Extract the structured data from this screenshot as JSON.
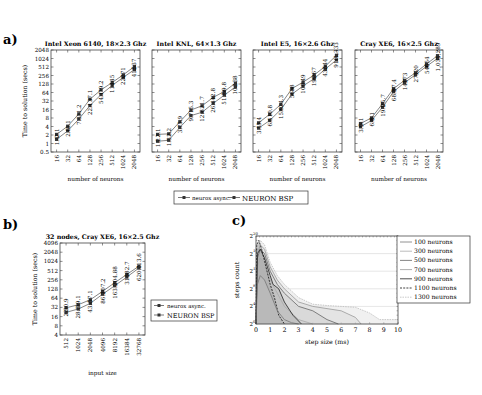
{
  "panel_labels": {
    "a": "a)",
    "b": "b)",
    "c": "c)"
  },
  "colors": {
    "async": "#666666",
    "bsp": "#666666",
    "frame": "#444444",
    "marker": "#333333"
  },
  "chart_data": [
    {
      "id": "a1",
      "type": "line",
      "title": "Intel Xeon 6140, 18×2.3 Ghz",
      "xlabel": "number of neurons",
      "ylabel": "Time to solution (secs)",
      "x": [
        16,
        32,
        64,
        128,
        256,
        512,
        1024,
        2048
      ],
      "yticks": [
        "0.5",
        "1",
        "2",
        "4",
        "8",
        "16",
        "32",
        "64",
        "128",
        "256",
        "512",
        "1024",
        "2048"
      ],
      "ylim_log2": [
        -1,
        11
      ],
      "series": [
        {
          "name": "neurox async.",
          "values": [
            1.4,
            2.8,
            7.3,
            22.1,
            54.1,
            114,
            220,
            415
          ],
          "labels": [
            "1.4",
            "2.8",
            "7.3",
            "22.1",
            "54.1",
            "114",
            "220",
            "415"
          ]
        },
        {
          "name": "NEURON BSP",
          "values": [
            2.1,
            4.1,
            11.2,
            37.1,
            79.2,
            145,
            271,
            537
          ],
          "labels": [
            "2.1",
            "4.1",
            "11.2",
            "37.1",
            "79.2",
            "145",
            "271",
            "537"
          ]
        }
      ]
    },
    {
      "id": "a2",
      "type": "line",
      "title": "Intel KNL, 64×1.3 Ghz",
      "xlabel": "number of neurons",
      "ylabel": "",
      "x": [
        16,
        32,
        64,
        128,
        256,
        512,
        1024,
        2048
      ],
      "ylim_log2": [
        -1,
        11
      ],
      "series": [
        {
          "name": "neurox async.",
          "values": [
            1.2,
            1.3,
            3.7,
            9.7,
            12.8,
            26.4,
            51.5,
            101
          ],
          "labels": [
            "1.2",
            "1.3",
            "3.7",
            "9.7",
            "12.8",
            "26.4",
            "51.5",
            "101"
          ]
        },
        {
          "name": "NEURON BSP",
          "values": [
            2.1,
            2.2,
            5.9,
            15.3,
            21.7,
            42.8,
            69.8,
            138
          ],
          "labels": [
            "2.1",
            "2.2",
            "5.9",
            "15.3",
            "21.7",
            "42.8",
            "69.8",
            "138"
          ]
        }
      ]
    },
    {
      "id": "a3",
      "type": "line",
      "title": "Intel E5, 16×2.6 Ghz",
      "xlabel": "number of neurons",
      "ylabel": "",
      "x": [
        16,
        32,
        64,
        128,
        256,
        512,
        1024,
        2048
      ],
      "ylim_log2": [
        -1,
        11
      ],
      "series": [
        {
          "name": "neurox async.",
          "values": [
            3.5,
            6.5,
            15.9,
            56,
            109,
            199,
            432,
            910
          ],
          "labels": [
            "3.5",
            "6.5",
            "15.9",
            "56",
            "109",
            "199",
            "432",
            "910"
          ]
        },
        {
          "name": "NEURON BSP",
          "values": [
            5.4,
            10.8,
            24.3,
            88,
            149,
            267,
            544,
            1333
          ],
          "labels": [
            "5.4",
            "10.8",
            "24.3",
            "88",
            "149",
            "267",
            "544",
            "1,333"
          ]
        }
      ]
    },
    {
      "id": "a4",
      "type": "line",
      "title": "Cray XE6, 16×2.5 Ghz",
      "xlabel": "number of neurons",
      "ylabel": "",
      "x": [
        16,
        32,
        64,
        128,
        256,
        512,
        1024,
        2048
      ],
      "ylim_log2": [
        -1,
        11
      ],
      "series": [
        {
          "name": "neurox async.",
          "values": [
            3.9,
            6.5,
            19.1,
            68.3,
            143,
            271,
            540,
            1033
          ],
          "labels": [
            "3.9",
            "6.5",
            "19.1",
            "68.3",
            "143",
            "271",
            "540",
            "1,033"
          ]
        },
        {
          "name": "NEURON BSP",
          "values": [
            5.1,
            8.1,
            25.7,
            87.4,
            173,
            320,
            654,
            1289
          ],
          "labels": [
            "5.1",
            "8.1",
            "25.7",
            "87.4",
            "173",
            "320",
            "654",
            "1,289"
          ]
        }
      ]
    },
    {
      "id": "b",
      "type": "line",
      "title": "32 nodes, Cray XE6, 16×2.5 Ghz",
      "xlabel": "input size",
      "ylabel": "Time to solution (secs)",
      "x": [
        512,
        1024,
        2048,
        4096,
        8192,
        16384,
        32768
      ],
      "yticks": [
        "4",
        "8",
        "16",
        "32",
        "64",
        "128",
        "256",
        "512",
        "1024",
        "2048",
        "4096"
      ],
      "ylim_log2": [
        2,
        12
      ],
      "series": [
        {
          "name": "neurox async.",
          "values": [
            22,
            28.3,
            43.4,
            86.2,
            163.3,
            314,
            620.1
          ],
          "labels": [
            "22",
            "28.3",
            "43.4",
            "86.2",
            "163.3",
            "314",
            "620.1"
          ]
        },
        {
          "name": "NEURON BSP",
          "values": [
            30.9,
            39.1,
            57.1,
            107.2,
            204.88,
            382.7,
            713.6
          ],
          "labels": [
            "30.9",
            "39.1",
            "57.1",
            "107.2",
            "204.88",
            "382.7",
            "713.6"
          ]
        }
      ],
      "legend": [
        "neurox async.",
        "NEURON BSP"
      ]
    },
    {
      "id": "c",
      "type": "area",
      "title": "",
      "xlabel": "step size (ms)",
      "ylabel": "steps count",
      "xticks": [
        0,
        1,
        2,
        3,
        4,
        5,
        6,
        7,
        8,
        9,
        10
      ],
      "yticks": [
        "2^0",
        "2^4",
        "2^8",
        "2^12",
        "2^16",
        "2^20"
      ],
      "xlim": [
        0,
        10
      ],
      "ylim_log2": [
        0,
        20
      ],
      "grid": true,
      "series": [
        {
          "name": "100 neurons",
          "x": [
            0,
            0.1,
            0.3,
            0.6,
            1,
            1.5,
            2,
            2.5,
            3
          ],
          "log2y": [
            0,
            9,
            11,
            10,
            7,
            3,
            1,
            0.3,
            0
          ]
        },
        {
          "name": "300 neurons",
          "x": [
            0,
            0.1,
            0.3,
            0.6,
            1,
            1.5,
            2,
            3,
            4
          ],
          "log2y": [
            0,
            13,
            15,
            14,
            10,
            7,
            4,
            1,
            0
          ]
        },
        {
          "name": "500 neurons",
          "x": [
            0,
            0.1,
            0.3,
            0.6,
            1,
            1.5,
            2,
            3,
            4,
            5,
            5.8
          ],
          "log2y": [
            0,
            15,
            17,
            16,
            12,
            9,
            7,
            4,
            3,
            1,
            0
          ]
        },
        {
          "name": "700 neurons",
          "x": [
            0,
            0.1,
            0.3,
            0.6,
            1,
            1.5,
            2,
            3,
            4,
            5,
            6,
            7,
            7.4
          ],
          "log2y": [
            0,
            16,
            18,
            17,
            13,
            10,
            8,
            5,
            4,
            3.5,
            3,
            1.5,
            0
          ]
        },
        {
          "name": "900 neurons",
          "x": [
            0,
            0.1,
            0.3,
            0.6,
            1,
            1.2,
            1.6,
            2,
            2.6,
            3.2
          ],
          "log2y": [
            0,
            16,
            17,
            15,
            11,
            9,
            8,
            5,
            2,
            0
          ]
        },
        {
          "name": "1100 neurons",
          "x": [
            0,
            0.05,
            0.2,
            0.4,
            0.7,
            1,
            1.3,
            1.6,
            2
          ],
          "log2y": [
            0,
            18,
            19,
            17,
            13,
            9,
            6,
            2,
            0
          ]
        },
        {
          "name": "1300 neurons",
          "x": [
            0,
            0.1,
            0.3,
            0.6,
            1,
            1.5,
            2,
            3,
            4,
            5,
            6,
            7,
            8,
            8.7,
            10
          ],
          "log2y": [
            0,
            17,
            19,
            18,
            14,
            11,
            9,
            6,
            4.5,
            4.2,
            4,
            3.8,
            2.5,
            1,
            1
          ]
        }
      ],
      "legend": [
        "100 neurons",
        "300 neurons",
        "500 neurons",
        "700 neurons",
        "900 neurons",
        "1100 neurons",
        "1300 neurons"
      ]
    }
  ],
  "legend_a": [
    "neurox async.",
    "NEURON BSP"
  ]
}
